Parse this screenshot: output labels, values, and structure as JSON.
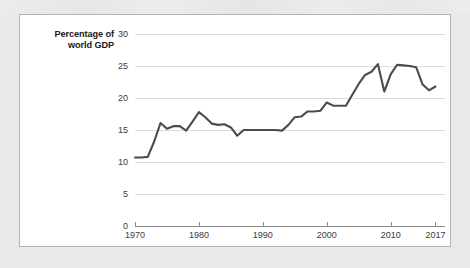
{
  "chart_data": {
    "type": "line",
    "title": "",
    "subtitle": "",
    "xlabel": "",
    "ylabel": "Percentage of world GDP",
    "ylabel_lines": [
      "Percentage of",
      "world GDP"
    ],
    "xlim": [
      1970,
      2018.5
    ],
    "ylim": [
      0,
      30
    ],
    "grid": true,
    "legend": "none",
    "line_color": "#4c4c4c",
    "grid_color": "#dcdcdc",
    "axis_color": "#8e8e8e",
    "panel_background": "#ffffff",
    "page_background": "#e9e9e9",
    "yticks": [
      0,
      5,
      10,
      15,
      20,
      25,
      30
    ],
    "ytick_labels": [
      "0",
      "5",
      "10",
      "15",
      "20",
      "25",
      "30"
    ],
    "xticks": [
      1970,
      1980,
      1990,
      2000,
      2010,
      2017
    ],
    "xtick_labels": [
      "1970",
      "1980",
      "1990",
      "2000",
      "2010",
      "2017"
    ],
    "series": [
      {
        "name": "Trade as percentage of world GDP",
        "x": [
          1970,
          1971,
          1972,
          1973,
          1974,
          1975,
          1976,
          1977,
          1978,
          1979,
          1980,
          1981,
          1982,
          1983,
          1984,
          1985,
          1986,
          1987,
          1988,
          1989,
          1990,
          1991,
          1992,
          1993,
          1994,
          1995,
          1996,
          1997,
          1998,
          1999,
          2000,
          2001,
          2002,
          2003,
          2004,
          2005,
          2006,
          2007,
          2008,
          2009,
          2010,
          2011,
          2012,
          2013,
          2014,
          2015,
          2016,
          2017
        ],
        "y": [
          10.7,
          10.7,
          10.8,
          13.2,
          16.1,
          15.2,
          15.6,
          15.6,
          14.9,
          16.3,
          17.8,
          17.0,
          16.0,
          15.8,
          15.9,
          15.4,
          14.1,
          15.0,
          15.0,
          15.0,
          15.0,
          15.0,
          15.0,
          14.9,
          15.8,
          17.0,
          17.1,
          17.9,
          17.9,
          18.0,
          19.3,
          18.8,
          18.8,
          18.8,
          20.5,
          22.2,
          23.6,
          24.1,
          25.3,
          21.0,
          23.7,
          25.2,
          25.1,
          25.0,
          24.8,
          22.1,
          21.2,
          21.8
        ]
      }
    ]
  }
}
